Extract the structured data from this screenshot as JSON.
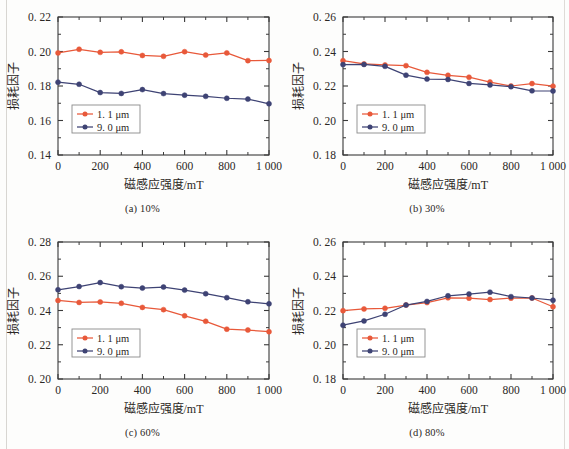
{
  "figure": {
    "panel_count": 4,
    "series_colors": {
      "s1": "#e8593a",
      "s2": "#3e4374"
    },
    "axis_color": "#3a3a3a",
    "text_color": "#2b2724"
  },
  "labels": {
    "xlabel": "磁感应强度/mT",
    "ylabel": "损耗因子",
    "legend_1": "1. 1 μm",
    "legend_2": "9. 0 μm",
    "caption_a": "(a) 10%",
    "caption_b": "(b) 30%",
    "caption_c": "(c) 60%",
    "caption_d": "(d) 80%"
  },
  "xticks": [
    "0",
    "200",
    "400",
    "600",
    "800",
    "1 000"
  ],
  "yticks_a": [
    "0. 14",
    "0. 16",
    "0. 18",
    "0. 20",
    "0. 22"
  ],
  "yticks_b": [
    "0. 18",
    "0. 20",
    "0. 22",
    "0. 24",
    "0. 26"
  ],
  "yticks_c": [
    "0. 20",
    "0. 22",
    "0. 24",
    "0. 26",
    "0. 28"
  ],
  "yticks_d": [
    "0. 18",
    "0. 20",
    "0. 22",
    "0. 24",
    "0. 26"
  ],
  "chart_data": [
    {
      "id": "a",
      "type": "line",
      "title": "(a) 10%",
      "xlabel": "磁感应强度/mT",
      "ylabel": "损耗因子",
      "xlim": [
        0,
        1000
      ],
      "ylim": [
        0.14,
        0.22
      ],
      "xticks": [
        0,
        200,
        400,
        600,
        800,
        1000
      ],
      "yticks": [
        0.14,
        0.16,
        0.18,
        0.2,
        0.22
      ],
      "grid": false,
      "legend_position": "lower-left",
      "x": [
        0,
        100,
        200,
        300,
        400,
        500,
        600,
        700,
        800,
        900,
        1000
      ],
      "series": [
        {
          "name": "1. 1 μm",
          "color": "#e8593a",
          "values": [
            0.1992,
            0.2013,
            0.1995,
            0.1998,
            0.1977,
            0.1972,
            0.1999,
            0.1979,
            0.1992,
            0.1947,
            0.1948
          ]
        },
        {
          "name": "9. 0 μm",
          "color": "#3e4374",
          "values": [
            0.1822,
            0.181,
            0.1762,
            0.1757,
            0.1779,
            0.1756,
            0.1747,
            0.174,
            0.1729,
            0.1724,
            0.1697
          ]
        }
      ]
    },
    {
      "id": "b",
      "type": "line",
      "title": "(b) 30%",
      "xlabel": "磁感应强度/mT",
      "ylabel": "损耗因子",
      "xlim": [
        0,
        1000
      ],
      "ylim": [
        0.18,
        0.26
      ],
      "xticks": [
        0,
        200,
        400,
        600,
        800,
        1000
      ],
      "yticks": [
        0.18,
        0.2,
        0.22,
        0.24,
        0.26
      ],
      "grid": false,
      "legend_position": "lower-left",
      "x": [
        0,
        100,
        200,
        300,
        400,
        500,
        600,
        700,
        800,
        900,
        1000
      ],
      "series": [
        {
          "name": "1. 1 μm",
          "color": "#e8593a",
          "values": [
            0.2347,
            0.2328,
            0.2322,
            0.2318,
            0.2279,
            0.2262,
            0.2251,
            0.2223,
            0.22,
            0.2214,
            0.2199
          ]
        },
        {
          "name": "9. 0 μm",
          "color": "#3e4374",
          "values": [
            0.2324,
            0.2325,
            0.2314,
            0.2263,
            0.224,
            0.2238,
            0.2215,
            0.2206,
            0.2196,
            0.2172,
            0.2171
          ]
        }
      ]
    },
    {
      "id": "c",
      "type": "line",
      "title": "(c) 60%",
      "xlabel": "磁感应强度/mT",
      "ylabel": "损耗因子",
      "xlim": [
        0,
        1000
      ],
      "ylim": [
        0.2,
        0.28
      ],
      "xticks": [
        0,
        200,
        400,
        600,
        800,
        1000
      ],
      "yticks": [
        0.2,
        0.22,
        0.24,
        0.26,
        0.28
      ],
      "grid": false,
      "legend_position": "lower-left",
      "x": [
        0,
        100,
        200,
        300,
        400,
        500,
        600,
        700,
        800,
        900,
        1000
      ],
      "series": [
        {
          "name": "1. 1 μm",
          "color": "#e8593a",
          "values": [
            0.2459,
            0.2447,
            0.245,
            0.2442,
            0.2418,
            0.2405,
            0.2369,
            0.2337,
            0.2291,
            0.2286,
            0.2276
          ]
        },
        {
          "name": "9. 0 μm",
          "color": "#3e4374",
          "values": [
            0.2521,
            0.254,
            0.2563,
            0.2539,
            0.2531,
            0.2537,
            0.2519,
            0.2498,
            0.2475,
            0.2451,
            0.2439
          ]
        }
      ]
    },
    {
      "id": "d",
      "type": "line",
      "title": "(d) 80%",
      "xlabel": "磁感应强度/mT",
      "ylabel": "损耗因子",
      "xlim": [
        0,
        1000
      ],
      "ylim": [
        0.18,
        0.26
      ],
      "xticks": [
        0,
        200,
        400,
        600,
        800,
        1000
      ],
      "yticks": [
        0.18,
        0.2,
        0.22,
        0.24,
        0.26
      ],
      "grid": false,
      "legend_position": "lower-left",
      "x": [
        0,
        100,
        200,
        300,
        400,
        500,
        600,
        700,
        800,
        900,
        1000
      ],
      "series": [
        {
          "name": "1. 1 μm",
          "color": "#e8593a",
          "values": [
            0.2199,
            0.2209,
            0.2213,
            0.2232,
            0.2246,
            0.2274,
            0.2272,
            0.2264,
            0.2272,
            0.2273,
            0.2222
          ]
        },
        {
          "name": "9. 0 μm",
          "color": "#3e4374",
          "values": [
            0.2114,
            0.2139,
            0.2178,
            0.2232,
            0.2253,
            0.2286,
            0.2296,
            0.2307,
            0.2281,
            0.2273,
            0.226
          ]
        }
      ]
    }
  ]
}
